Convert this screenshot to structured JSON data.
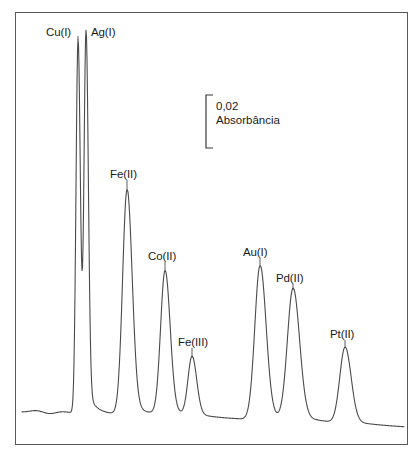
{
  "figure": {
    "background_color": "#ffffff",
    "frame_color": "#58585a",
    "trace_color": "#4a4a4a"
  },
  "scale_bar": {
    "value_label": "0,02",
    "unit_label": "Absorbância",
    "bracket_top_y": 95,
    "bracket_bottom_y": 148
  },
  "peak_labels": [
    {
      "text": "Cu(I)",
      "x": 46,
      "y": 26
    },
    {
      "text": "Ag(I)",
      "x": 91,
      "y": 26
    },
    {
      "text": "Fe(II)",
      "x": 110,
      "y": 168
    },
    {
      "text": "Co(II)",
      "x": 148,
      "y": 250
    },
    {
      "text": "Fe(III)",
      "x": 178,
      "y": 336
    },
    {
      "text": "Au(I)",
      "x": 243,
      "y": 246
    },
    {
      "text": "Pd(II)",
      "x": 276,
      "y": 272
    },
    {
      "text": "Pt(II)",
      "x": 330,
      "y": 328
    }
  ],
  "chart_data": {
    "type": "line",
    "title": "",
    "xlabel": "",
    "ylabel": "Absorbância",
    "xlim": [
      15,
      408
    ],
    "ylim_pixels": [
      445,
      12
    ],
    "grid": false,
    "legend": "none",
    "y_scale_bar": {
      "value": 0.02,
      "unit": "Absorbância",
      "pixel_height": 53
    },
    "baseline": {
      "start_y": 412,
      "end_y": 427,
      "noise_amplitude": 2
    },
    "series": [
      {
        "name": "Absorbance trace",
        "peaks": [
          {
            "label": "Cu(I)",
            "apex_x": 78,
            "apex_y": 40,
            "width": 5,
            "height_abs": 0.14
          },
          {
            "label": "Ag(I)",
            "apex_x": 86,
            "apex_y": 38,
            "width": 5,
            "height_abs": 0.141
          },
          {
            "label": "Fe(II)",
            "apex_x": 127,
            "apex_y": 190,
            "width": 11,
            "height_abs": 0.084
          },
          {
            "label": "Co(II)",
            "apex_x": 165,
            "apex_y": 272,
            "width": 11,
            "height_abs": 0.053
          },
          {
            "label": "Fe(III)",
            "apex_x": 192,
            "apex_y": 358,
            "width": 10,
            "height_abs": 0.021
          },
          {
            "label": "Au(I)",
            "apex_x": 260,
            "apex_y": 266,
            "width": 13,
            "height_abs": 0.055
          },
          {
            "label": "Pd(II)",
            "apex_x": 293,
            "apex_y": 290,
            "width": 14,
            "height_abs": 0.046
          },
          {
            "label": "Pt(II)",
            "apex_x": 345,
            "apex_y": 348,
            "width": 13,
            "height_abs": 0.025
          }
        ]
      }
    ]
  }
}
